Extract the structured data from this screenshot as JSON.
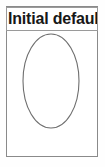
{
  "figure": {
    "label_box": {
      "text": "Initial default f",
      "truncated": true,
      "bold": true,
      "text_color": "#171717",
      "border_color": "#9a9a9a",
      "background": "#ffffff"
    },
    "frame": {
      "border_color": "#8a8a8a",
      "background": "#ffffff"
    },
    "shape": {
      "name": "ellipse",
      "stroke_color": "#6e6e6e",
      "fill": "none"
    },
    "canvas": {
      "background": "#fefefe"
    }
  }
}
